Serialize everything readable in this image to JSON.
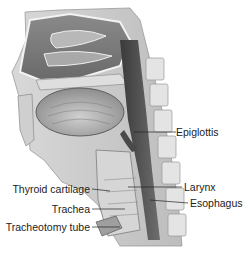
{
  "figure": {
    "labels": [
      {
        "id": "epiglottis",
        "text": "Epiglottis",
        "side": "right"
      },
      {
        "id": "larynx",
        "text": "Larynx",
        "side": "right"
      },
      {
        "id": "esophagus",
        "text": "Esophagus",
        "side": "right"
      },
      {
        "id": "thyroid-cartilage",
        "text": "Thyroid cartilage",
        "side": "left"
      },
      {
        "id": "trachea",
        "text": "Trachea",
        "side": "left"
      },
      {
        "id": "tracheotomy-tube",
        "text": "Tracheotomy tube",
        "side": "left"
      }
    ]
  }
}
